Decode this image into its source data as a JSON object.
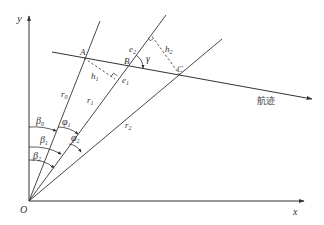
{
  "diagram": {
    "axes": {
      "x_label": "x",
      "y_label": "y",
      "origin_label": "O"
    },
    "rays": [
      {
        "name": "r0",
        "label": "r",
        "sub": "0"
      },
      {
        "name": "r1",
        "label": "r",
        "sub": "1"
      },
      {
        "name": "r2",
        "label": "r",
        "sub": "2"
      }
    ],
    "points": [
      {
        "name": "A",
        "label": "A"
      },
      {
        "name": "B",
        "label": "B"
      },
      {
        "name": "C",
        "label": "C"
      }
    ],
    "perpendiculars": [
      {
        "name": "h1",
        "label": "h",
        "sub": "1"
      },
      {
        "name": "h2",
        "label": "h",
        "sub": "2"
      }
    ],
    "feet": [
      {
        "name": "e1",
        "label": "e",
        "sub": "1"
      },
      {
        "name": "e2",
        "label": "e",
        "sub": "2"
      }
    ],
    "angles": {
      "beta0": {
        "label": "β",
        "sub": "0"
      },
      "beta1": {
        "label": "β",
        "sub": "1"
      },
      "beta2": {
        "label": "β",
        "sub": "2"
      },
      "phi1": {
        "label": "φ",
        "sub": "1"
      },
      "phi2": {
        "label": "φ",
        "sub": "2"
      },
      "gamma": {
        "label": "γ"
      }
    },
    "track_label": "航迹",
    "colors": {
      "line": "#333333",
      "background": "#ffffff"
    }
  }
}
